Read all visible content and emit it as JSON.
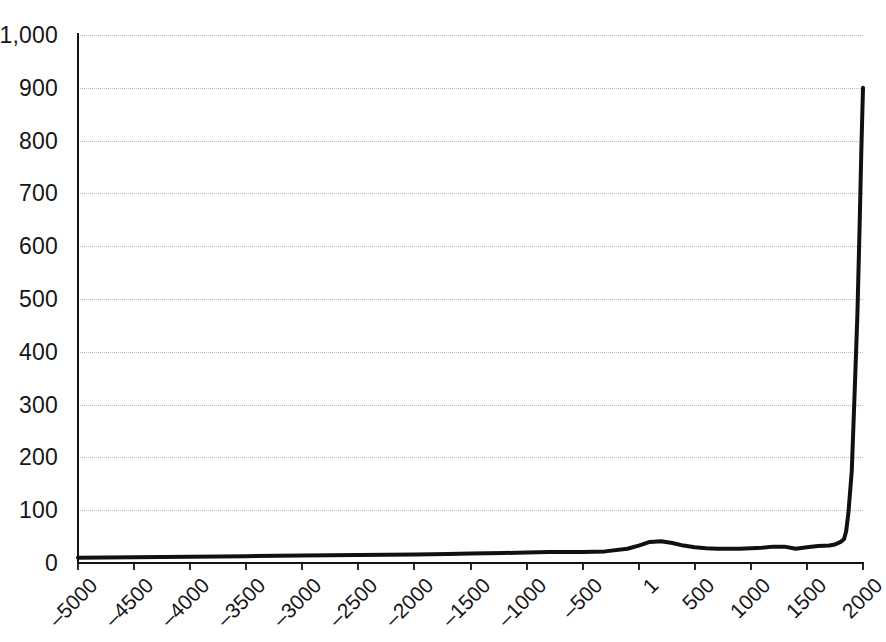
{
  "chart_data": {
    "type": "line",
    "title": "",
    "subtitle": "",
    "xlabel": "",
    "ylabel": "",
    "xlim": [
      -5000,
      2000
    ],
    "ylim": [
      0,
      1000
    ],
    "grid": true,
    "legend": false,
    "legend_position": "none",
    "y_ticks": [
      "0",
      "100",
      "200",
      "300",
      "400",
      "500",
      "600",
      "700",
      "800",
      "900",
      "1,000"
    ],
    "y_tick_values": [
      0,
      100,
      200,
      300,
      400,
      500,
      600,
      700,
      800,
      900,
      1000
    ],
    "x_ticks": [
      "-5000",
      "-4500",
      "-4000",
      "-3500",
      "-3000",
      "-2500",
      "-2000",
      "-1500",
      "-1000",
      "-500",
      "1",
      "500",
      "1000",
      "1500",
      "2000"
    ],
    "x_tick_values": [
      -5000,
      -4500,
      -4000,
      -3500,
      -3000,
      -2500,
      -2000,
      -1500,
      -1000,
      -500,
      1,
      500,
      1000,
      1500,
      2000
    ],
    "series": [
      {
        "name": "series-1",
        "color": "#101010",
        "x": [
          -5000,
          -4500,
          -4000,
          -3500,
          -3000,
          -2500,
          -2000,
          -1700,
          -1500,
          -1200,
          -1000,
          -800,
          -600,
          -500,
          -300,
          -100,
          1,
          100,
          200,
          300,
          400,
          500,
          600,
          700,
          800,
          900,
          1000,
          1100,
          1200,
          1300,
          1400,
          1500,
          1600,
          1700,
          1750,
          1800,
          1830,
          1850,
          1870,
          1900,
          1925,
          1950,
          1970,
          1985,
          2000
        ],
        "y": [
          10,
          11,
          12,
          13,
          14,
          15,
          16,
          17,
          18,
          19,
          20,
          21,
          21,
          21,
          22,
          27,
          33,
          40,
          41,
          38,
          33,
          30,
          28,
          27,
          27,
          27,
          28,
          29,
          31,
          31,
          27,
          30,
          32,
          33,
          35,
          40,
          45,
          60,
          95,
          175,
          320,
          470,
          640,
          780,
          900
        ]
      }
    ]
  }
}
